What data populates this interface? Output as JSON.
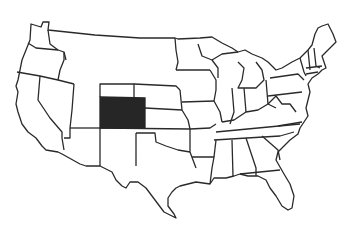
{
  "map": {
    "type": "choropleth-outline",
    "region": "United States (contiguous)",
    "highlighted_state": "Colorado",
    "highlight_color": "#262626",
    "border_color": "#2a2a2a",
    "background_color": "#ffffff",
    "labels": []
  }
}
